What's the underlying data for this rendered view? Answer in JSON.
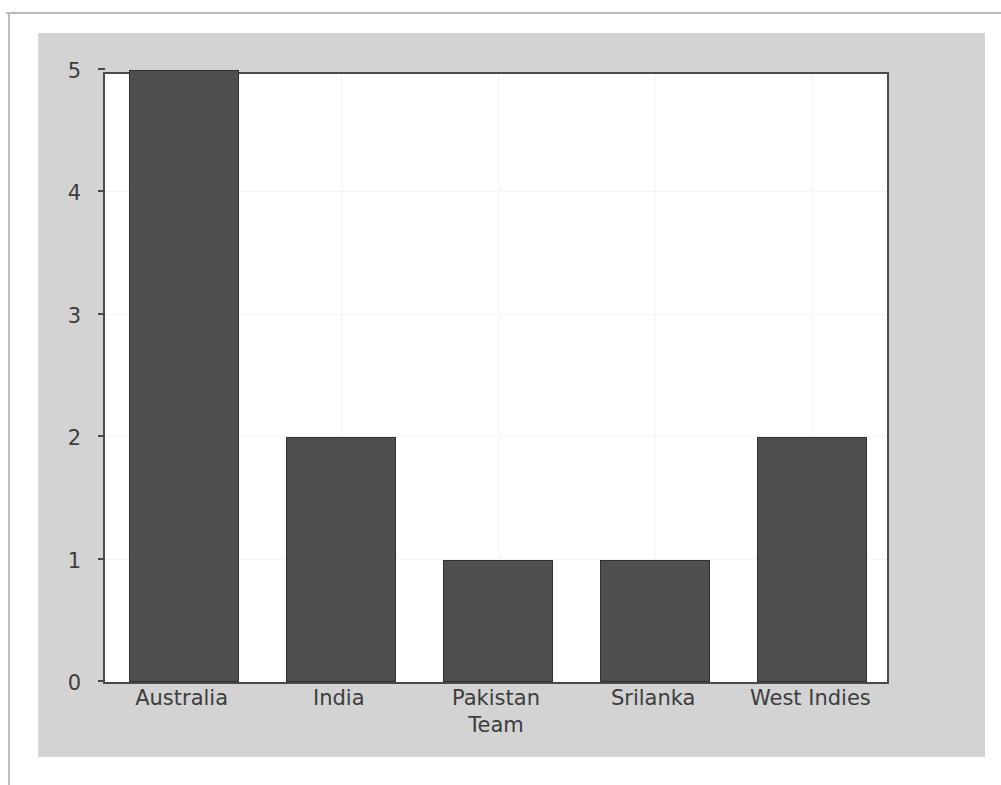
{
  "figure": {
    "canvas_color": "#d3d3d3",
    "plot_background": "#ffffff",
    "frame_color": "#4a4a4a"
  },
  "chart_data": {
    "type": "bar",
    "title": "",
    "subtitle": "",
    "categories": [
      "Australia",
      "India",
      "Pakistan",
      "Srilanka",
      "West Indies"
    ],
    "values": [
      5,
      2,
      1,
      1,
      2
    ],
    "xlabel": "Team",
    "ylabel": "",
    "xlim_categories": 5,
    "ylim": [
      0,
      5
    ],
    "yticks": [
      0,
      1,
      2,
      3,
      4,
      5
    ],
    "ytick_labels": [
      "0",
      "1",
      "2",
      "3",
      "4",
      "5"
    ],
    "xtick_labels": [
      "Australia",
      "India",
      "Pakistan",
      "Srilanka",
      "West Indies"
    ],
    "grid": true,
    "grid_style": "dotted",
    "grid_color": "#ededed",
    "legend": null,
    "legend_position": "none",
    "bar_color": "#4f4f4f",
    "bar_edge_color": "#2f2f2f",
    "annotations": []
  }
}
